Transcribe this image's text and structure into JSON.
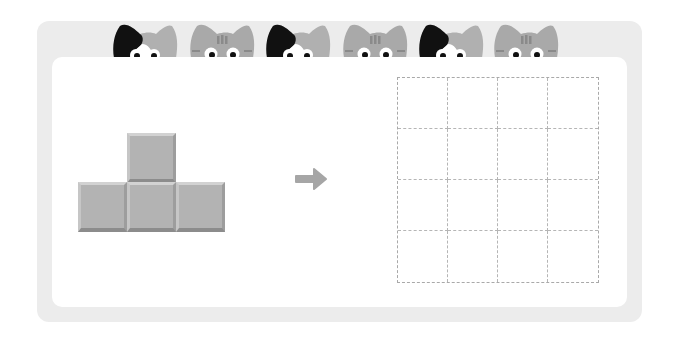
{
  "puzzle": {
    "type": "shape-copy",
    "source_shape": {
      "name": "T-tetromino",
      "blocks": [
        {
          "col": 1,
          "row": 0
        },
        {
          "col": 0,
          "row": 1
        },
        {
          "col": 1,
          "row": 1
        },
        {
          "col": 2,
          "row": 1
        }
      ],
      "block_color": "#b3b3b3"
    },
    "arrow": "right-arrow",
    "target_grid": {
      "rows": 4,
      "cols": 4,
      "line_style": "dashed",
      "line_color": "#a9a9a9"
    }
  },
  "decoration": {
    "cats": [
      "calico",
      "tabby",
      "calico",
      "tabby",
      "calico",
      "tabby"
    ]
  },
  "colors": {
    "frame": "#ececec",
    "panel": "#ffffff",
    "arrow": "#a6a6a6"
  }
}
